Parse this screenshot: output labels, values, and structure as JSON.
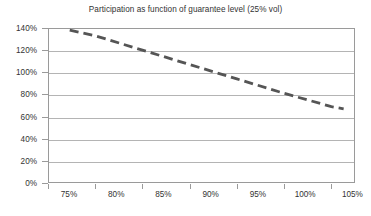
{
  "chart_data": {
    "type": "line",
    "title": "Participation as function of guarantee level (25% vol)",
    "xlabel": "",
    "ylabel": "",
    "grid": true,
    "legend": false,
    "legend_position": "none",
    "xlim": [
      75,
      107.5
    ],
    "ylim": [
      0,
      140
    ],
    "x_tick_labels": [
      "75%",
      "80%",
      "85%",
      "90%",
      "95%",
      "100%",
      "105%"
    ],
    "x_ticks": [
      75,
      80,
      85,
      90,
      95,
      100,
      105
    ],
    "y_tick_labels": [
      "0%",
      "20%",
      "40%",
      "60%",
      "80%",
      "100%",
      "120%",
      "140%"
    ],
    "y_ticks": [
      0,
      20,
      40,
      60,
      80,
      100,
      120,
      140
    ],
    "series": [
      {
        "name": "Participation",
        "style": "dashed",
        "color": "#555555",
        "x": [
          77.3,
          80,
          85,
          90,
          95,
          100,
          105,
          106.3
        ],
        "values": [
          138,
          133,
          120,
          107,
          94,
          81,
          69,
          67
        ]
      }
    ]
  },
  "axis_colors": {
    "frame": "#9a9a9a",
    "gridline": "#b4b4b4",
    "text": "#333333",
    "background": "#ffffff"
  }
}
